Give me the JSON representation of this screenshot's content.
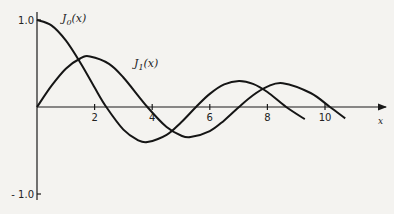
{
  "chart_data": {
    "type": "line",
    "title": "",
    "xlabel": "x",
    "ylabel": "",
    "xlim": [
      0,
      11.5
    ],
    "ylim": [
      -1.0,
      1.0
    ],
    "grid": false,
    "x_ticks": [
      2,
      4,
      6,
      8,
      10
    ],
    "x_tick_labels": [
      "2",
      "4",
      "6",
      "8",
      "10"
    ],
    "y_ticks": [
      1.0,
      -1.0
    ],
    "y_tick_labels": [
      "1.0",
      "- 1.0"
    ],
    "legend": "inline labels",
    "series": [
      {
        "name": "J0(x)",
        "label": "J",
        "label_sub": "0",
        "label_suffix": "(x)",
        "x": [
          0,
          0.5,
          1,
          1.5,
          2,
          2.4048,
          3,
          3.5,
          3.8317,
          4.5,
          5,
          5.5201,
          6,
          6.5,
          7.0156,
          7.5,
          8,
          8.6537,
          9.3
        ],
        "values": [
          1.0,
          0.938,
          0.765,
          0.512,
          0.224,
          0.0,
          -0.26,
          -0.38,
          -0.403,
          -0.321,
          -0.178,
          0.0,
          0.151,
          0.26,
          0.3,
          0.266,
          0.172,
          0.0,
          -0.14
        ]
      },
      {
        "name": "J1(x)",
        "label": "J",
        "label_sub": "1",
        "label_suffix": "(x)",
        "x": [
          0,
          0.5,
          1,
          1.5,
          1.8412,
          2.5,
          3,
          3.8317,
          4.5,
          5,
          5.3314,
          6,
          6.5,
          7.0156,
          7.5,
          8,
          8.5363,
          9.5,
          10.1735,
          10.7
        ],
        "values": [
          0.0,
          0.242,
          0.44,
          0.558,
          0.582,
          0.497,
          0.339,
          0.0,
          -0.231,
          -0.328,
          -0.346,
          -0.277,
          -0.154,
          0.0,
          0.135,
          0.235,
          0.273,
          0.161,
          0.0,
          -0.131
        ]
      }
    ]
  }
}
